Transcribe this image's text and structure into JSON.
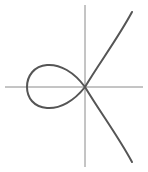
{
  "diagram": {
    "type": "curve-plot",
    "axes": {
      "origin": [
        85,
        87
      ],
      "x_axis": {
        "x1": 5,
        "x2": 143
      },
      "y_axis": {
        "y1": 5,
        "y2": 167
      },
      "color": "#8a8a8a"
    },
    "curve": {
      "color": "#555555",
      "stroke_width": 2,
      "loop_leftmost_x": 27,
      "upper_branch_end": [
        132,
        12
      ],
      "lower_branch_end": [
        132,
        162
      ]
    }
  }
}
